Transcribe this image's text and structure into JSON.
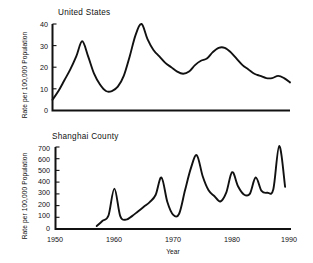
{
  "figure": {
    "background_color": "#ffffff",
    "line_color": "#111111",
    "xlabel": "Year",
    "panels": [
      {
        "title": "United States",
        "ylabel": "Rate per 100,000 Population"
      },
      {
        "title": "Shanghai County",
        "ylabel": "Rate per 100,000 Population"
      }
    ]
  },
  "chart_data": [
    {
      "type": "line",
      "title": "United States",
      "xlabel": "",
      "ylabel": "Rate per 100,000 Population",
      "xlim": [
        1950,
        1990
      ],
      "ylim": [
        0,
        40
      ],
      "xticks": [
        1950,
        1960,
        1970,
        1980,
        1990
      ],
      "xtick_labels": [
        "1950",
        "1960",
        "1970",
        "1980",
        "1990"
      ],
      "yticks": [
        0,
        10,
        20,
        30,
        40
      ],
      "ytick_labels": [
        "0",
        "10",
        "20",
        "30",
        "40"
      ],
      "grid": false,
      "legend": null,
      "series": [
        {
          "name": "United States",
          "x": [
            1950,
            1951,
            1952,
            1953,
            1954,
            1955,
            1956,
            1957,
            1958,
            1959,
            1960,
            1961,
            1962,
            1963,
            1964,
            1965,
            1966,
            1967,
            1968,
            1969,
            1970,
            1971,
            1972,
            1973,
            1974,
            1975,
            1976,
            1977,
            1978,
            1979,
            1980,
            1981,
            1982,
            1983,
            1984,
            1985,
            1986,
            1987,
            1988,
            1989,
            1990
          ],
          "y": [
            5,
            9,
            14,
            19,
            25,
            32,
            25,
            17,
            12,
            9,
            9,
            11,
            16,
            25,
            35,
            40,
            33,
            28,
            25,
            22,
            20,
            18,
            17,
            18,
            21,
            23,
            24,
            27,
            29,
            29,
            27,
            24,
            21,
            19,
            17,
            16,
            15,
            15,
            16,
            15,
            13
          ]
        }
      ]
    },
    {
      "type": "line",
      "title": "Shanghai County",
      "xlabel": "Year",
      "ylabel": "Rate per 100,000 Population",
      "xlim": [
        1950,
        1990
      ],
      "ylim": [
        0,
        700
      ],
      "xticks": [
        1950,
        1960,
        1970,
        1980,
        1990
      ],
      "xtick_labels": [
        "1950",
        "1960",
        "1970",
        "1980",
        "1990"
      ],
      "yticks": [
        0,
        100,
        200,
        300,
        400,
        500,
        600,
        700
      ],
      "ytick_labels": [
        "0",
        "100",
        "200",
        "300",
        "400",
        "500",
        "600",
        "700"
      ],
      "grid": false,
      "legend": null,
      "series": [
        {
          "name": "Shanghai County",
          "x": [
            1957,
            1958,
            1959,
            1960,
            1961,
            1962,
            1963,
            1964,
            1965,
            1966,
            1967,
            1968,
            1969,
            1970,
            1971,
            1972,
            1973,
            1974,
            1975,
            1976,
            1977,
            1978,
            1979,
            1980,
            1981,
            1982,
            1983,
            1984,
            1985,
            1986,
            1987,
            1988,
            1989
          ],
          "y": [
            25,
            70,
            115,
            345,
            110,
            80,
            110,
            150,
            190,
            230,
            290,
            440,
            230,
            120,
            130,
            330,
            520,
            630,
            450,
            330,
            280,
            235,
            310,
            485,
            365,
            295,
            300,
            440,
            325,
            310,
            340,
            710,
            360
          ]
        }
      ]
    }
  ]
}
